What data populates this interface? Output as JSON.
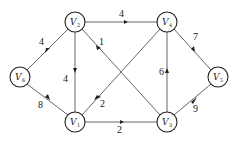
{
  "graph": {
    "title": "",
    "directed": true,
    "nodes": [
      {
        "id": "V1",
        "label": "V",
        "sub": "1",
        "x": 75,
        "y": 122
      },
      {
        "id": "V2",
        "label": "V",
        "sub": "2",
        "x": 75,
        "y": 22
      },
      {
        "id": "V3",
        "label": "V",
        "sub": "3",
        "x": 167,
        "y": 122
      },
      {
        "id": "V4",
        "label": "V",
        "sub": "4",
        "x": 167,
        "y": 22
      },
      {
        "id": "V5",
        "label": "V",
        "sub": "5",
        "x": 218,
        "y": 77
      },
      {
        "id": "V6",
        "label": "V",
        "sub": "6",
        "x": 20,
        "y": 77
      }
    ],
    "edges": [
      {
        "from": "V2",
        "to": "V4",
        "weight": "4"
      },
      {
        "from": "V2",
        "to": "V6",
        "weight": "4"
      },
      {
        "from": "V2",
        "to": "V1",
        "weight": "4"
      },
      {
        "from": "V3",
        "to": "V2",
        "weight": "1"
      },
      {
        "from": "V6",
        "to": "V1",
        "weight": "8"
      },
      {
        "from": "V4",
        "to": "V1",
        "weight": "2"
      },
      {
        "from": "V1",
        "to": "V3",
        "weight": "2"
      },
      {
        "from": "V3",
        "to": "V4",
        "weight": "6"
      },
      {
        "from": "V4",
        "to": "V5",
        "weight": "7"
      },
      {
        "from": "V3",
        "to": "V5",
        "weight": "9"
      }
    ]
  }
}
